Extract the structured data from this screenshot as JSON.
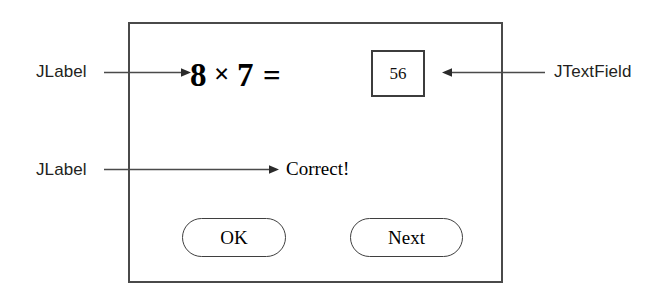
{
  "figure": {
    "caption_absent": true,
    "background_color": "#ffffff",
    "line_color": "#4a4a4a"
  },
  "dialog": {
    "name": "multiplication-quiz-dialog",
    "border_color": "#4a4a4a",
    "background_color": "#ffffff",
    "question": {
      "operand_left": "8",
      "operator": "×",
      "operand_right": "7",
      "equals": "=",
      "full_text": "8 × 7 ="
    },
    "answer_field": {
      "value": "56",
      "placeholder": ""
    },
    "feedback": {
      "text": "Correct!"
    },
    "buttons": [
      {
        "id": "ok",
        "label": "OK"
      },
      {
        "id": "next",
        "label": "Next"
      }
    ]
  },
  "annotations": [
    {
      "id": "jlabel-question",
      "label": "JLabel",
      "points_to": "question-label",
      "direction": "right"
    },
    {
      "id": "jtextfield",
      "label": "JTextField",
      "points_to": "answer-field",
      "direction": "left"
    },
    {
      "id": "jlabel-feedback",
      "label": "JLabel",
      "points_to": "feedback-label",
      "direction": "right"
    }
  ]
}
